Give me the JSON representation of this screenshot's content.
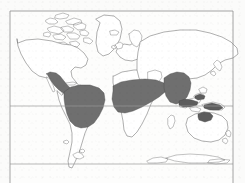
{
  "figure": {
    "kind": "world-distribution-map",
    "projection": "rectangular",
    "caption_fragment": "",
    "background_color": "#fbfbfa",
    "frame_color": "#8e8e8e",
    "coastline_color": "#6e6e6e",
    "shading_color": "#6f6f6f"
  },
  "frame": {
    "left": 10,
    "top": 11,
    "right": 233,
    "bottom": 183
  },
  "gridlines": [
    {
      "name": "equator",
      "y": 106
    },
    {
      "name": "southern-latitude-line",
      "y": 164
    }
  ],
  "shaded_regions": [
    {
      "name": "mexico-central-america",
      "label": "Mexico / Central America"
    },
    {
      "name": "northern-south-america",
      "label": "Amazon Basin / Northern South America"
    },
    {
      "name": "west-central-africa",
      "label": "West & Central Africa"
    },
    {
      "name": "south-southeast-asia",
      "label": "South & Southeast Asia"
    },
    {
      "name": "indonesia-new-guinea",
      "label": "Indonesia / New Guinea"
    },
    {
      "name": "northeast-australia",
      "label": "Northeast Australia"
    }
  ],
  "landmasses": [
    {
      "name": "north-america"
    },
    {
      "name": "greenland"
    },
    {
      "name": "south-america"
    },
    {
      "name": "europe"
    },
    {
      "name": "africa"
    },
    {
      "name": "asia"
    },
    {
      "name": "australia"
    },
    {
      "name": "new-zealand"
    },
    {
      "name": "antarctica"
    },
    {
      "name": "japan"
    },
    {
      "name": "british-isles"
    },
    {
      "name": "madagascar"
    },
    {
      "name": "arctic-islands"
    }
  ]
}
